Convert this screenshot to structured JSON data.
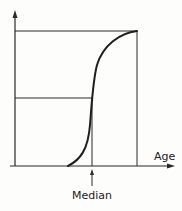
{
  "diagram": {
    "type": "cumulative-distribution-curve",
    "x_axis_label": "Age",
    "marker_label": "Median",
    "colors": {
      "stroke": "#2a2a2a",
      "background": "#fdfdfb"
    }
  }
}
